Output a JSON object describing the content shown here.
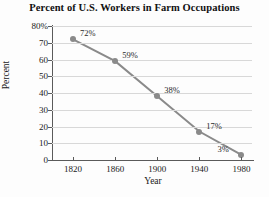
{
  "chart_data": {
    "type": "line",
    "title": "Percent of U.S. Workers in Farm Occupations",
    "xlabel": "Year",
    "ylabel": "Percent",
    "x": [
      1820,
      1860,
      1900,
      1940,
      1980
    ],
    "values": [
      72,
      59,
      38,
      17,
      3
    ],
    "point_labels": [
      "72%",
      "59%",
      "38%",
      "17%",
      "3%"
    ],
    "xlim": [
      1800,
      1990
    ],
    "ylim": [
      0,
      80
    ],
    "xticks": [
      1820,
      1860,
      1900,
      1940,
      1980
    ],
    "xtick_labels": [
      "1820",
      "1860",
      "1900",
      "1940",
      "1980"
    ],
    "yticks": [
      0,
      10,
      20,
      30,
      40,
      50,
      60,
      70,
      80
    ],
    "ytick_labels": [
      "0",
      "10",
      "20",
      "30",
      "40",
      "50",
      "60",
      "70",
      "80%"
    ],
    "grid": "horizontal",
    "legend": "none",
    "series_color": "#8a8a8a",
    "grid_color": "#d8d8d8",
    "axis_color": "#5a5a5a",
    "label_positions": [
      "right-above",
      "right-above",
      "right-above",
      "right-above",
      "left-above"
    ]
  }
}
